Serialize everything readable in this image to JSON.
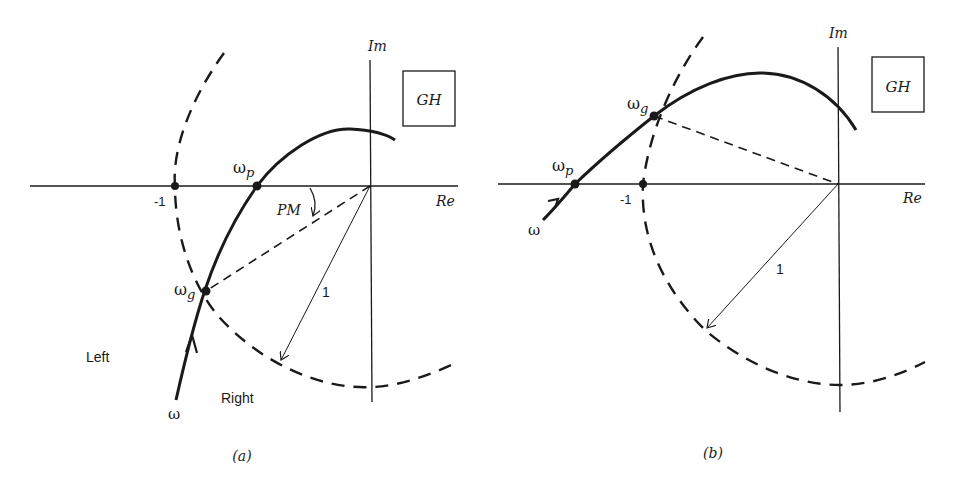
{
  "figure": {
    "colors": {
      "ink": "#1a1a1a",
      "background": "#ffffff"
    }
  },
  "panel_a": {
    "caption": "(a)",
    "axis_re_label": "Re",
    "axis_im_label": "Im",
    "box_label": "GH",
    "minus_one_label": "-1",
    "omega_p_label": "ω",
    "omega_p_sub": "p",
    "omega_g_label": "ω",
    "omega_g_sub": "g",
    "omega_label": "ω",
    "pm_label": "PM",
    "radius_label": "1",
    "left_label": "Left",
    "right_label": "Right"
  },
  "panel_b": {
    "caption": "(b)",
    "axis_re_label": "Re",
    "axis_im_label": "Im",
    "box_label": "GH",
    "minus_one_label": "-1",
    "omega_p_label": "ω",
    "omega_p_sub": "p",
    "omega_g_label": "ω",
    "omega_g_sub": "g",
    "omega_label": "ω",
    "radius_label": "1"
  }
}
